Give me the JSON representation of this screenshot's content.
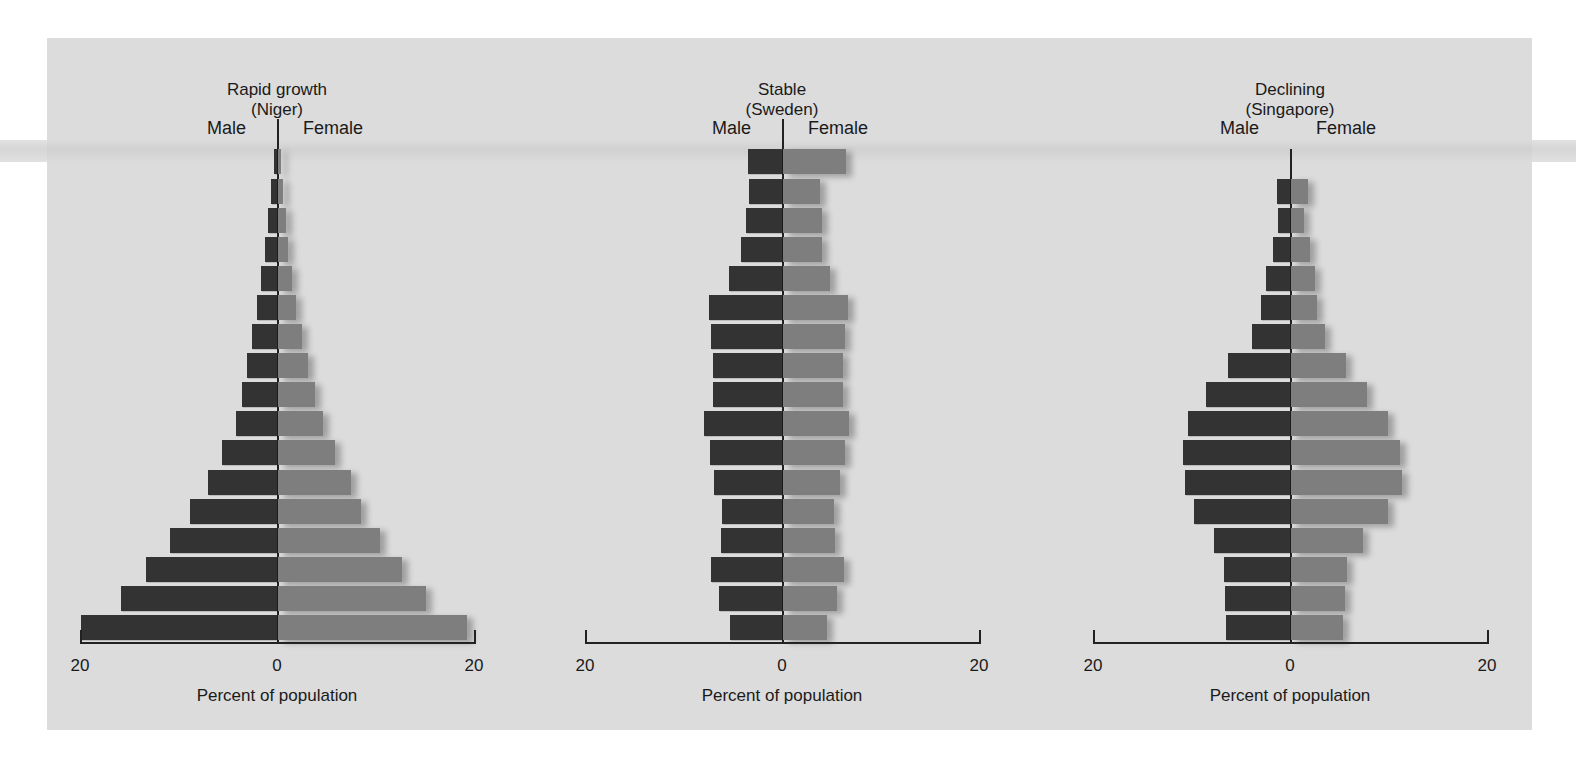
{
  "chart_data": [
    {
      "type": "bar",
      "orientation": "horizontal-population-pyramid",
      "title": "Rapid growth",
      "subtitle": "(Niger)",
      "left_label": "Male",
      "right_label": "Female",
      "xlabel": "Percent of population",
      "xlim": [
        20,
        0,
        20
      ],
      "tick_labels": [
        "20",
        "0",
        "20"
      ],
      "age_groups_top_to_bottom": 17,
      "series": [
        {
          "name": "Male",
          "color": "#333333",
          "values": [
            0.3,
            0.6,
            0.9,
            1.2,
            1.6,
            2.0,
            2.5,
            3.0,
            3.6,
            4.2,
            5.6,
            7.0,
            8.8,
            10.9,
            13.3,
            15.8,
            19.9
          ]
        },
        {
          "name": "Female",
          "color": "#7e7e7e",
          "values": [
            0.3,
            0.5,
            0.8,
            1.0,
            1.4,
            1.8,
            2.4,
            3.0,
            3.8,
            4.6,
            5.8,
            7.4,
            8.4,
            10.4,
            12.6,
            15.0,
            19.2
          ]
        }
      ]
    },
    {
      "type": "bar",
      "orientation": "horizontal-population-pyramid",
      "title": "Stable",
      "subtitle": "(Sweden)",
      "left_label": "Male",
      "right_label": "Female",
      "xlabel": "Percent of population",
      "xlim": [
        20,
        0,
        20
      ],
      "tick_labels": [
        "20",
        "0",
        "20"
      ],
      "age_groups_top_to_bottom": 17,
      "series": [
        {
          "name": "Male",
          "color": "#333333",
          "values": [
            3.5,
            3.3,
            3.7,
            4.2,
            5.4,
            7.4,
            7.2,
            7.0,
            7.0,
            7.9,
            7.3,
            6.9,
            6.1,
            6.2,
            7.2,
            6.4,
            5.3
          ]
        },
        {
          "name": "Female",
          "color": "#7e7e7e",
          "values": [
            6.4,
            3.8,
            4.0,
            4.0,
            4.8,
            6.6,
            6.3,
            6.1,
            6.1,
            6.7,
            6.3,
            5.8,
            5.2,
            5.3,
            6.2,
            5.5,
            4.5
          ]
        }
      ]
    },
    {
      "type": "bar",
      "orientation": "horizontal-population-pyramid",
      "title": "Declining",
      "subtitle": "(Singapore)",
      "left_label": "Male",
      "right_label": "Female",
      "xlabel": "Percent of population",
      "xlim": [
        20,
        0,
        20
      ],
      "tick_labels": [
        "20",
        "0",
        "20"
      ],
      "age_groups_top_to_bottom": 16,
      "series": [
        {
          "name": "Male",
          "color": "#333333",
          "values": [
            1.3,
            1.2,
            1.7,
            2.4,
            2.9,
            3.9,
            6.3,
            8.5,
            10.4,
            10.9,
            10.7,
            9.7,
            7.7,
            6.7,
            6.6,
            6.5
          ]
        },
        {
          "name": "Female",
          "color": "#7e7e7e",
          "values": [
            1.7,
            1.3,
            1.9,
            2.4,
            2.6,
            3.5,
            5.6,
            7.7,
            9.8,
            11.1,
            11.3,
            9.8,
            7.3,
            5.7,
            5.5,
            5.3
          ]
        }
      ]
    }
  ],
  "labels": {
    "male": "Male",
    "female": "Female",
    "xlabel": "Percent of population",
    "tick_left": "20",
    "tick_zero": "0",
    "tick_right": "20"
  },
  "pyramids": [
    {
      "title": "Rapid growth",
      "subtitle": "(Niger)"
    },
    {
      "title": "Stable",
      "subtitle": "(Sweden)"
    },
    {
      "title": "Declining",
      "subtitle": "(Singapore)"
    }
  ]
}
